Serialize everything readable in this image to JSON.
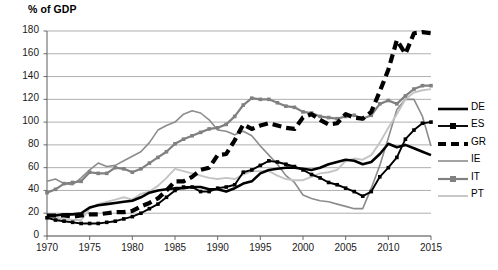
{
  "chart_data": {
    "type": "line",
    "title": "% of GDP",
    "subtitle": "",
    "xlabel": "",
    "ylabel": "% of GDP",
    "xlim": [
      1970,
      2015
    ],
    "ylim": [
      0,
      180
    ],
    "ytick_step": 20,
    "xtick_step": 5,
    "grid": "horizontal",
    "legend_position": "right",
    "ytick_labels": [
      "0",
      "20",
      "40",
      "60",
      "80",
      "100",
      "120",
      "140",
      "160",
      "180"
    ],
    "xtick_labels": [
      "1970",
      "1975",
      "1980",
      "1985",
      "1990",
      "1995",
      "2000",
      "2005",
      "2010",
      "2015"
    ],
    "x": [
      1970,
      1971,
      1972,
      1973,
      1974,
      1975,
      1976,
      1977,
      1978,
      1979,
      1980,
      1981,
      1982,
      1983,
      1984,
      1985,
      1986,
      1987,
      1988,
      1989,
      1990,
      1991,
      1992,
      1993,
      1994,
      1995,
      1996,
      1997,
      1998,
      1999,
      2000,
      2001,
      2002,
      2003,
      2004,
      2005,
      2006,
      2007,
      2008,
      2009,
      2010,
      2011,
      2012,
      2013,
      2014,
      2015
    ],
    "series": [
      {
        "name": "DE",
        "color": "#000000",
        "style": "solid",
        "width": 2.6,
        "marker": "none",
        "values": [
          18,
          18,
          19,
          19,
          20,
          25,
          27,
          28,
          29,
          30,
          31,
          34,
          38,
          40,
          41,
          42,
          42,
          43,
          43,
          41,
          41,
          39,
          42,
          46,
          48,
          55,
          58,
          59,
          60,
          60,
          59,
          58,
          60,
          63,
          65,
          67,
          66,
          63,
          65,
          72,
          81,
          78,
          80,
          77,
          74,
          71
        ]
      },
      {
        "name": "ES",
        "color": "#000000",
        "style": "solid",
        "width": 1.9,
        "marker": "square",
        "values": [
          16,
          14,
          13,
          12,
          11,
          11,
          11,
          12,
          13,
          15,
          17,
          20,
          24,
          28,
          34,
          40,
          43,
          43,
          39,
          39,
          42,
          43,
          45,
          56,
          58,
          62,
          66,
          65,
          63,
          61,
          58,
          54,
          51,
          47,
          45,
          42,
          39,
          35,
          39,
          52,
          60,
          69,
          85,
          93,
          99,
          100
        ]
      },
      {
        "name": "GR",
        "color": "#000000",
        "style": "dashed",
        "width": 4.2,
        "marker": "none",
        "values": [
          18,
          18,
          18,
          17,
          18,
          19,
          19,
          20,
          21,
          21,
          22,
          26,
          29,
          33,
          40,
          48,
          48,
          52,
          58,
          60,
          71,
          72,
          84,
          98,
          94,
          97,
          99,
          97,
          95,
          94,
          104,
          107,
          102,
          98,
          99,
          107,
          104,
          103,
          109,
          127,
          146,
          172,
          160,
          178,
          179,
          178
        ]
      },
      {
        "name": "IE",
        "color": "#8c8c8c",
        "style": "solid",
        "width": 1.6,
        "marker": "none",
        "values": [
          48,
          50,
          46,
          45,
          51,
          58,
          64,
          61,
          62,
          66,
          70,
          74,
          82,
          93,
          97,
          100,
          107,
          110,
          108,
          102,
          93,
          92,
          89,
          92,
          88,
          79,
          71,
          63,
          53,
          47,
          36,
          33,
          31,
          30,
          28,
          26,
          24,
          24,
          42,
          62,
          86,
          111,
          120,
          120,
          105,
          79
        ]
      },
      {
        "name": "IT",
        "color": "#808080",
        "style": "solid",
        "width": 2.2,
        "marker": "square",
        "values": [
          38,
          41,
          46,
          47,
          48,
          56,
          55,
          55,
          60,
          59,
          56,
          59,
          64,
          69,
          74,
          81,
          85,
          88,
          91,
          94,
          95,
          98,
          105,
          115,
          121,
          120,
          120,
          117,
          114,
          113,
          109,
          108,
          105,
          104,
          103,
          105,
          106,
          103,
          106,
          116,
          119,
          116,
          123,
          129,
          132,
          132
        ]
      },
      {
        "name": "PT",
        "color": "#c4c4c4",
        "style": "solid",
        "width": 1.9,
        "marker": "none",
        "values": [
          17,
          16,
          15,
          14,
          14,
          24,
          28,
          30,
          32,
          34,
          32,
          37,
          39,
          44,
          51,
          59,
          57,
          55,
          53,
          51,
          50,
          51,
          50,
          54,
          57,
          57,
          57,
          53,
          50,
          49,
          49,
          52,
          55,
          56,
          58,
          66,
          68,
          67,
          71,
          82,
          95,
          107,
          120,
          126,
          128,
          129
        ]
      }
    ]
  },
  "legend": {
    "items": [
      {
        "label": "DE"
      },
      {
        "label": "ES"
      },
      {
        "label": "GR"
      },
      {
        "label": "IE"
      },
      {
        "label": "IT"
      },
      {
        "label": "PT"
      }
    ]
  }
}
